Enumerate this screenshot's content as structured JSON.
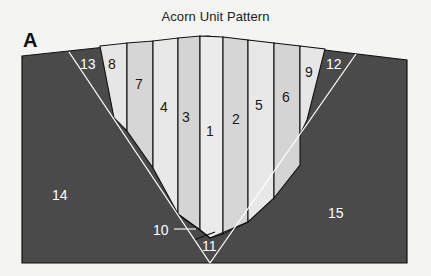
{
  "title": "Acorn Unit Pattern",
  "block_letter": "A",
  "colors": {
    "background": "#f4f4f3",
    "dark_fabric": "#4a4a4a",
    "light_stripe_a": "#e8e8e8",
    "light_stripe_b": "#d4d4d4",
    "seam_line": "#ffffff",
    "outline": "#111111"
  },
  "pieces": [
    {
      "id": "1",
      "label": "1",
      "tone": "light"
    },
    {
      "id": "2",
      "label": "2",
      "tone": "light"
    },
    {
      "id": "3",
      "label": "3",
      "tone": "light"
    },
    {
      "id": "4",
      "label": "4",
      "tone": "light"
    },
    {
      "id": "5",
      "label": "5",
      "tone": "light"
    },
    {
      "id": "6",
      "label": "6",
      "tone": "light"
    },
    {
      "id": "7",
      "label": "7",
      "tone": "light"
    },
    {
      "id": "8",
      "label": "8",
      "tone": "light"
    },
    {
      "id": "9",
      "label": "9",
      "tone": "light"
    },
    {
      "id": "10",
      "label": "10",
      "tone": "dark"
    },
    {
      "id": "11",
      "label": "11",
      "tone": "dark"
    },
    {
      "id": "12",
      "label": "12",
      "tone": "dark"
    },
    {
      "id": "13",
      "label": "13",
      "tone": "dark"
    },
    {
      "id": "14",
      "label": "14",
      "tone": "dark"
    },
    {
      "id": "15",
      "label": "15",
      "tone": "dark"
    }
  ]
}
